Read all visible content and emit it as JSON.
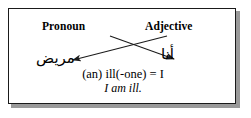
{
  "figure": {
    "headers": {
      "left": "Pronoun",
      "right": "Adjective"
    },
    "terms": {
      "left_arabic": "مريض",
      "right_arabic": "أنا"
    },
    "gloss": {
      "literal": "(an) ill(-one) = I",
      "translation": "I am ill."
    },
    "connectors": [
      {
        "name": "pronoun-to-adjective",
        "from": "Pronoun",
        "to": "أنا",
        "direction": "left-to-right-down"
      },
      {
        "name": "adjective-to-pronoun",
        "from": "Adjective",
        "to": "مريض",
        "direction": "right-to-left-down"
      }
    ],
    "colors": {
      "ink": "#1a1a1a",
      "background": "#ffffff",
      "shadow": "#9a9a9a"
    }
  }
}
